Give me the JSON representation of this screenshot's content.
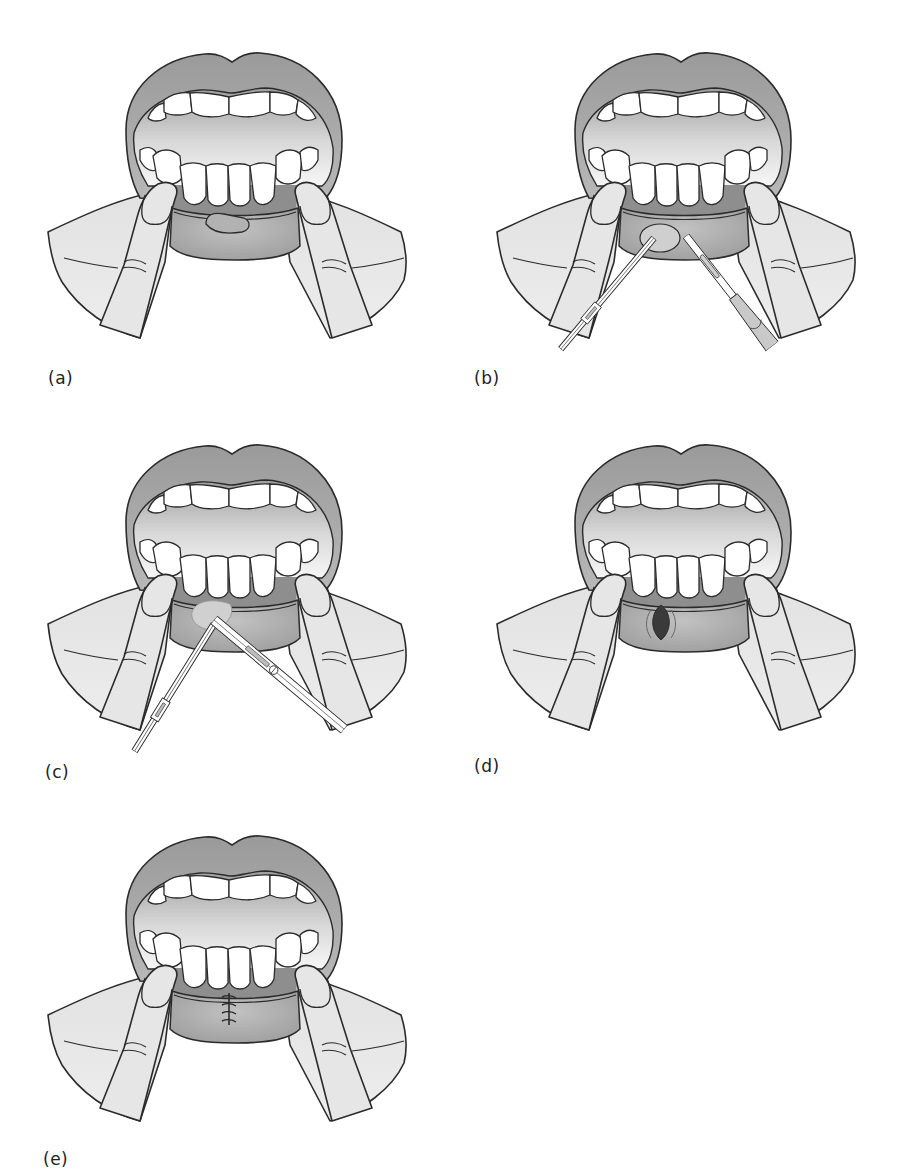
{
  "figure": {
    "panels": [
      {
        "id": "a",
        "label": "(a)",
        "content": "lower lip everted by fingers, lesion on inner lip"
      },
      {
        "id": "b",
        "label": "(b)",
        "content": "lesion grasped with forceps, incision with scalpel"
      },
      {
        "id": "c",
        "label": "(c)",
        "content": "lesion dissected with forceps and scissors"
      },
      {
        "id": "d",
        "label": "(d)",
        "content": "elliptical defect after excision"
      },
      {
        "id": "e",
        "label": "(e)",
        "content": "wound closed with sutures"
      }
    ]
  },
  "colors": {
    "outline": "#2b2b2b",
    "lip": "#a9a9a9",
    "lip_light": "#c6c6c6",
    "mouth_interior_top": "#a8a8a8",
    "mouth_interior_bottom": "#f2f2f2",
    "teeth": "#ffffff",
    "gum": "#8c8c8c",
    "skin": "#e4e4e4",
    "lesion": "#c9c9c9",
    "defect": "#3a3a3a",
    "background": "#ffffff"
  }
}
